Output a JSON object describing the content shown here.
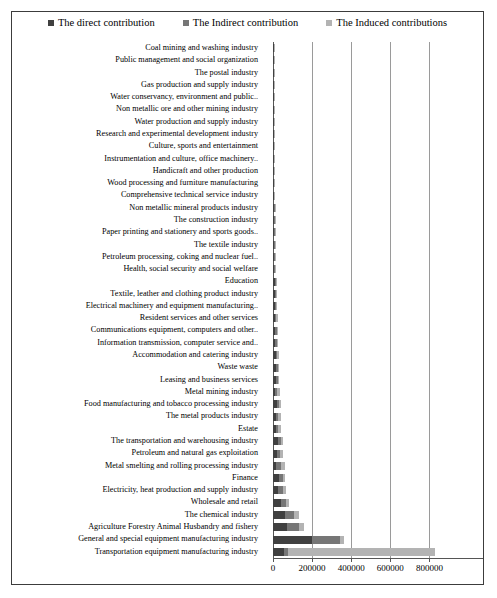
{
  "chart_data": {
    "type": "bar",
    "orientation": "horizontal",
    "stacked": true,
    "title": "",
    "xlabel": "",
    "ylabel": "",
    "xlim": [
      0,
      900000
    ],
    "xticks": [
      0,
      200000,
      400000,
      600000,
      800000
    ],
    "xtick_labels": [
      "0",
      "200000",
      "400000",
      "600000",
      "800000"
    ],
    "grid": true,
    "legend_position": "top",
    "legend": [
      {
        "label": "The direct contribution",
        "color": "#404040"
      },
      {
        "label": "The Indirect contribution",
        "color": "#767676"
      },
      {
        "label": "The Induced contributions",
        "color": "#b3b3b3"
      }
    ],
    "series": [
      {
        "name": "The direct contribution",
        "color": "#404040"
      },
      {
        "name": "The Indirect contribution",
        "color": "#767676"
      },
      {
        "name": "The Induced contributions",
        "color": "#b3b3b3"
      }
    ],
    "categories": [
      "Coal mining and washing industry",
      "Public management and social organization",
      "The postal industry",
      "Gas production and supply industry",
      "Water conservancy, environment and public..",
      "Non metallic ore and other mining industry",
      "Water production and supply industry",
      "Research and experimental development industry",
      "Culture, sports and entertainment",
      "Instrumentation and culture, office machinery..",
      "Handicraft and other production",
      "Wood processing and furniture manufacturing",
      "Comprehensive technical service industry",
      "Non metallic mineral products industry",
      "The construction industry",
      "Paper printing and stationery and sports goods..",
      "The textile industry",
      "Petroleum processing, coking and nuclear fuel..",
      "Health, social security and social welfare",
      "Education",
      "Textile, leather and clothing product industry",
      "Electrical machinery and equipment manufacturing..",
      "Resident services and other services",
      "Communications equipment, computers and other..",
      "Information transmission, computer service and..",
      "Accommodation and catering industry",
      "Waste waste",
      "Leasing and business services",
      "Metal mining industry",
      "Food manufacturing and tobacco processing industry",
      "The metal products industry",
      "Estate",
      "The transportation and warehousing industry",
      "Petroleum and natural gas exploitation",
      "Metal smelting and rolling processing industry",
      "Finance",
      "Electricity, heat production and supply industry",
      "Wholesale and retail",
      "The chemical industry",
      "Agriculture Forestry Animal Husbandry and fishery",
      "General and special equipment manufacturing industry",
      "Transportation equipment manufacturing industry"
    ],
    "values": {
      "direct": [
        900,
        1000,
        1100,
        1300,
        1400,
        1600,
        1800,
        2100,
        2400,
        2800,
        3300,
        3700,
        4300,
        4800,
        5200,
        5600,
        6400,
        7100,
        7600,
        8200,
        9000,
        9600,
        10500,
        11400,
        12000,
        13200,
        14500,
        13800,
        12000,
        18500,
        14000,
        13500,
        26000,
        21000,
        17000,
        30000,
        24000,
        40000,
        62000,
        72000,
        200000,
        57000
      ],
      "indirect": [
        600,
        700,
        800,
        900,
        1000,
        1100,
        1200,
        1400,
        1600,
        1900,
        2100,
        2400,
        2700,
        3000,
        3300,
        3600,
        4000,
        4600,
        4900,
        5200,
        5600,
        6300,
        6800,
        7400,
        7900,
        8500,
        9000,
        9800,
        11000,
        10500,
        13500,
        14500,
        14000,
        17000,
        22000,
        21000,
        25000,
        26000,
        44000,
        62000,
        145000,
        18000
      ],
      "induced": [
        400,
        450,
        500,
        600,
        700,
        800,
        900,
        1000,
        1200,
        1400,
        1600,
        1800,
        2100,
        2400,
        2700,
        3000,
        3400,
        3900,
        4300,
        4700,
        5100,
        5700,
        6200,
        6700,
        7200,
        7800,
        8400,
        9100,
        13000,
        9800,
        14000,
        13000,
        10000,
        13000,
        24000,
        11000,
        19000,
        15000,
        28000,
        26000,
        20000,
        755000
      ]
    }
  }
}
